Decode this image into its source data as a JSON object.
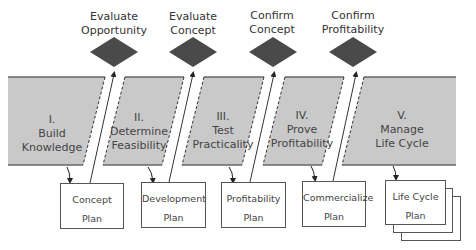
{
  "gates": [
    {
      "line1": "Evaluate",
      "line2": "Opportunity"
    },
    {
      "line1": "Evaluate",
      "line2": "Concept"
    },
    {
      "line1": "Confirm",
      "line2": "Concept"
    },
    {
      "line1": "Confirm",
      "line2": "Profitability"
    }
  ],
  "phases": [
    {
      "numeral": "I.",
      "line1": "Build",
      "line2": "Knowledge"
    },
    {
      "numeral": "II.",
      "line1": "Determine",
      "line2": "Feasibility"
    },
    {
      "numeral": "III.",
      "line1": "Test",
      "line2": "Practicality"
    },
    {
      "numeral": "IV.",
      "line1": "Prove",
      "line2": "Profitability"
    },
    {
      "numeral": "V.",
      "line1": "Manage",
      "line2": "Life Cycle"
    }
  ],
  "plans": [
    {
      "line1": "Concept",
      "line2": "Plan"
    },
    {
      "line1": "Development",
      "line2": "Plan"
    },
    {
      "line1": "Profitability",
      "line2": "Plan"
    },
    {
      "line1": "Commercialize",
      "line2": "Plan"
    },
    {
      "line1": "Life Cycle",
      "line2": "Plan"
    }
  ],
  "colors": {
    "band_fill": "#c9c9c9",
    "band_edge": "#6a6a6a",
    "diamond": "#4a4a4a",
    "line": "#333333"
  }
}
